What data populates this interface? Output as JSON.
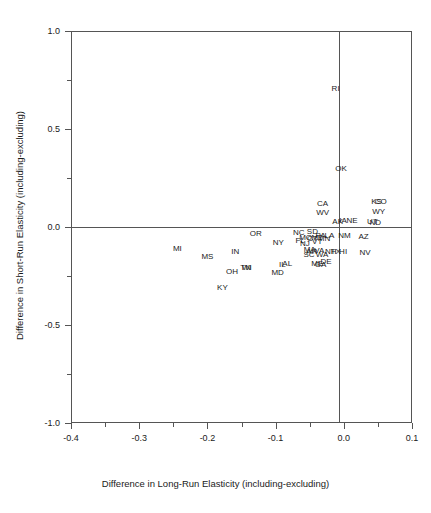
{
  "chart_data": {
    "type": "scatter",
    "title": "",
    "xlabel": "Difference in Long-Run Elasticity (including-excluding)",
    "ylabel": "Difference in Short-Run Elasticity (including-excluding)",
    "xlim": [
      -0.4,
      0.1
    ],
    "ylim": [
      -1.0,
      1.0
    ],
    "xticks": [
      -0.4,
      -0.3,
      -0.2,
      -0.1,
      0.0,
      0.1
    ],
    "xtick_labels": [
      "-0.4",
      "-0.3",
      "-0.2",
      "-0.1",
      "0.0",
      "0.1"
    ],
    "xminor_ticks": [
      -0.35,
      -0.25,
      -0.15,
      -0.05,
      0.05
    ],
    "yticks": [
      -1.0,
      -0.5,
      0.0,
      0.5,
      1.0
    ],
    "ytick_labels": [
      "-1.0",
      "-0.5",
      "0.0",
      "0.5",
      "1.0"
    ],
    "yminor_ticks": [
      -0.75,
      -0.25,
      0.25,
      0.75
    ],
    "grid": false,
    "legend": null,
    "reference_lines": [
      {
        "type": "vertical",
        "x": 0.0
      },
      {
        "type": "horizontal",
        "y": 0.0
      }
    ],
    "marker_style": "text-label",
    "points": [
      {
        "label": "RI",
        "x": -0.012,
        "y": 0.705
      },
      {
        "label": "OK",
        "x": -0.004,
        "y": 0.295
      },
      {
        "label": "KS",
        "x": 0.048,
        "y": 0.127
      },
      {
        "label": "CO",
        "x": 0.054,
        "y": 0.127
      },
      {
        "label": "CA",
        "x": -0.031,
        "y": 0.118
      },
      {
        "label": "WY",
        "x": 0.051,
        "y": 0.078
      },
      {
        "label": "WV",
        "x": -0.031,
        "y": 0.07
      },
      {
        "label": "AK",
        "x": -0.009,
        "y": 0.025
      },
      {
        "label": "IA",
        "x": -0.001,
        "y": 0.031
      },
      {
        "label": "NE",
        "x": 0.012,
        "y": 0.031
      },
      {
        "label": "UT",
        "x": 0.042,
        "y": 0.025
      },
      {
        "label": "ND",
        "x": 0.046,
        "y": 0.02
      },
      {
        "label": "NC",
        "x": -0.066,
        "y": -0.031
      },
      {
        "label": "SD",
        "x": -0.046,
        "y": -0.026
      },
      {
        "label": "LA",
        "x": -0.021,
        "y": -0.046
      },
      {
        "label": "NM",
        "x": 0.001,
        "y": -0.046
      },
      {
        "label": "AZ",
        "x": 0.029,
        "y": -0.051
      },
      {
        "label": "PA",
        "x": -0.034,
        "y": -0.046
      },
      {
        "label": "MO",
        "x": -0.056,
        "y": -0.056
      },
      {
        "label": "CT",
        "x": -0.046,
        "y": -0.061
      },
      {
        "label": "MT",
        "x": -0.039,
        "y": -0.056
      },
      {
        "label": "MN",
        "x": -0.029,
        "y": -0.061
      },
      {
        "label": "FL",
        "x": -0.064,
        "y": -0.072
      },
      {
        "label": "VT",
        "x": -0.039,
        "y": -0.077
      },
      {
        "label": "NJ",
        "x": -0.057,
        "y": -0.087
      },
      {
        "label": "NY",
        "x": -0.096,
        "y": -0.082
      },
      {
        "label": "OR",
        "x": -0.129,
        "y": -0.036
      },
      {
        "label": "NV",
        "x": 0.031,
        "y": -0.133
      },
      {
        "label": "MA",
        "x": -0.05,
        "y": -0.118
      },
      {
        "label": "AR",
        "x": -0.047,
        "y": -0.128
      },
      {
        "label": "VA",
        "x": -0.036,
        "y": -0.123
      },
      {
        "label": "NH",
        "x": -0.019,
        "y": -0.128
      },
      {
        "label": "TX",
        "x": -0.012,
        "y": -0.128
      },
      {
        "label": "HI",
        "x": -0.001,
        "y": -0.128
      },
      {
        "label": "SC",
        "x": -0.051,
        "y": -0.143
      },
      {
        "label": "WA",
        "x": -0.032,
        "y": -0.143
      },
      {
        "label": "MI",
        "x": -0.244,
        "y": -0.113
      },
      {
        "label": "IN",
        "x": -0.159,
        "y": -0.128
      },
      {
        "label": "MS",
        "x": -0.2,
        "y": -0.153
      },
      {
        "label": "DE",
        "x": -0.026,
        "y": -0.179
      },
      {
        "label": "ME",
        "x": -0.039,
        "y": -0.189
      },
      {
        "label": "GA",
        "x": -0.034,
        "y": -0.194
      },
      {
        "label": "IL",
        "x": -0.09,
        "y": -0.194
      },
      {
        "label": "AL",
        "x": -0.083,
        "y": -0.189
      },
      {
        "label": "TN",
        "x": -0.144,
        "y": -0.209
      },
      {
        "label": "WI",
        "x": -0.142,
        "y": -0.209
      },
      {
        "label": "OH",
        "x": -0.164,
        "y": -0.23
      },
      {
        "label": "MD",
        "x": -0.097,
        "y": -0.235
      },
      {
        "label": "KY",
        "x": -0.178,
        "y": -0.311
      }
    ]
  }
}
